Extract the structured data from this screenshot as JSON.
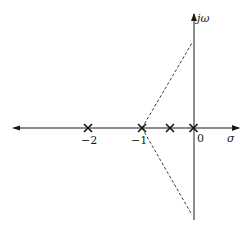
{
  "diagram": {
    "type": "root-locus-asymptotes",
    "axes": {
      "real_axis_label": "σ",
      "imag_axis_label": "jω",
      "origin_label": "0"
    },
    "ticks": [
      {
        "value": -2,
        "label": "−2"
      },
      {
        "value": -1,
        "label": "−1"
      }
    ],
    "poles": [
      {
        "real": -2,
        "imag": 0,
        "marker": "×"
      },
      {
        "real": -1,
        "imag": 0,
        "marker": "×"
      },
      {
        "real": -0.5,
        "imag": 0,
        "marker": "×"
      },
      {
        "real": 0,
        "imag": 0,
        "marker": "×"
      }
    ],
    "asymptotes": {
      "centroid": -1,
      "style": "dashed",
      "angles_deg": [
        60,
        -60,
        180
      ]
    },
    "colors": {
      "line": "#1a1a1a",
      "background": "#ffffff"
    }
  }
}
